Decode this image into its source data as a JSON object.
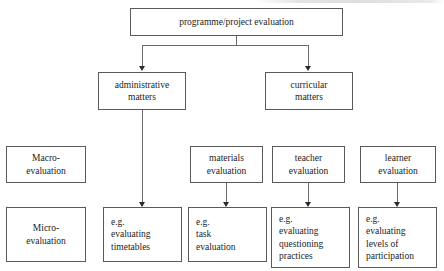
{
  "diagram": {
    "type": "tree-flowchart",
    "colors": {
      "background": "#ffffff",
      "box_border": "#5a5a5a",
      "connector": "#6a6a6a",
      "arrowhead": "#2b2b2b",
      "text": "#1c1c1c"
    },
    "nodes": {
      "root": {
        "label": "programme/project evaluation",
        "lines": [
          "programme/project evaluation"
        ]
      },
      "administrative": {
        "lines": [
          "administrative",
          "matters"
        ]
      },
      "curricular": {
        "lines": [
          "curricular",
          "matters"
        ]
      },
      "macro": {
        "lines": [
          "Macro-",
          "evaluation"
        ]
      },
      "micro": {
        "lines": [
          "Micro-",
          "evaluation"
        ]
      },
      "materials": {
        "lines": [
          "materials",
          "evaluation"
        ]
      },
      "teacher": {
        "lines": [
          "teacher",
          "evaluation"
        ]
      },
      "learner": {
        "lines": [
          "learner",
          "evaluation"
        ]
      },
      "eg_timetables": {
        "lines": [
          "e.g.",
          "evaluating",
          "timetables"
        ]
      },
      "eg_task": {
        "lines": [
          "e.g.",
          "task",
          "evaluation"
        ]
      },
      "eg_questioning": {
        "lines": [
          "e.g.",
          "evaluating",
          "questioning",
          "practices"
        ]
      },
      "eg_participation": {
        "lines": [
          "e.g.",
          "evaluating",
          "levels of",
          "participation"
        ]
      }
    }
  }
}
